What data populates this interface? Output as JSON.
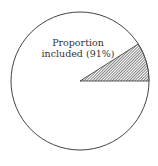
{
  "chart_data": {
    "type": "pie",
    "title": "",
    "slices": [
      {
        "label": "Proportion included",
        "value": 91,
        "fill": "#ffffff",
        "hatched": false
      },
      {
        "label": "Excluded",
        "value": 9,
        "fill": "#555555",
        "hatched": true
      }
    ],
    "annotations": [
      {
        "text_line1": "Proportion",
        "text_line2": "included (91%)"
      }
    ],
    "legend": "none",
    "colors": {
      "outline": "#444444",
      "hatch": "#333333",
      "background": "#ffffff"
    }
  }
}
